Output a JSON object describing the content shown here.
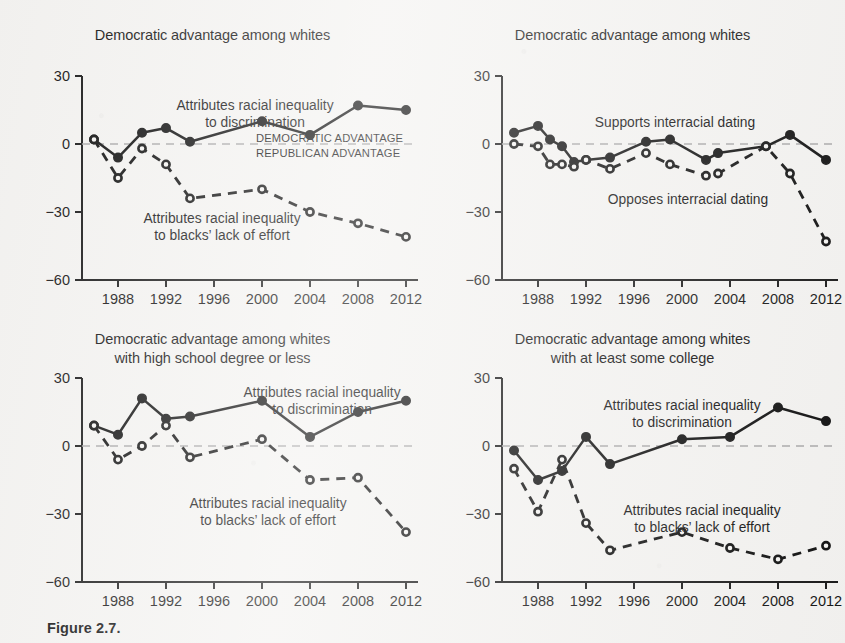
{
  "figure": {
    "caption": "Figure 2.7.",
    "background_color": "#f4f3f1",
    "ink_color": "#121212",
    "zero_line_color": "#a9a9a9",
    "advantage_note_color": "#8e8e8e"
  },
  "axis": {
    "y_ticks": [
      "30",
      "0",
      "−30",
      "−60"
    ],
    "y_values": [
      30,
      0,
      -30,
      -60
    ],
    "x_ticks": [
      "1988",
      "1992",
      "1996",
      "2000",
      "2004",
      "2008",
      "2012"
    ],
    "x_values": [
      1988,
      1992,
      1996,
      2000,
      2004,
      2008,
      2012
    ],
    "ylim": [
      -60,
      30
    ],
    "xlim": [
      1985,
      2013
    ]
  },
  "advantage_labels": {
    "democratic": "DEMOCRATIC ADVANTAGE",
    "republican": "REPUBLICAN ADVANTAGE"
  },
  "chart_data": [
    {
      "id": "panel-top-left",
      "type": "line",
      "title": "Democratic advantage among whites",
      "title_line2": "",
      "xlabel": "",
      "ylabel": "",
      "ylim": [
        -60,
        30
      ],
      "xlim": [
        1985,
        2013
      ],
      "grid": false,
      "zero_reference_line": true,
      "legend_position": "inline-annotations",
      "annotations": [
        {
          "text": "Attributes racial inequality",
          "text2": "to discrimination",
          "series": "discrimination"
        },
        {
          "text": "Attributes racial inequality",
          "text2": "to blacks’ lack of effort",
          "series": "effort"
        },
        {
          "text": "DEMOCRATIC ADVANTAGE",
          "series": "axis-note"
        },
        {
          "text": "REPUBLICAN ADVANTAGE",
          "series": "axis-note"
        }
      ],
      "series": [
        {
          "name": "Attributes racial inequality to discrimination",
          "style": "solid",
          "marker": "filled-circle",
          "x": [
            1986,
            1988,
            1990,
            1992,
            1994,
            2000,
            2004,
            2008,
            2012
          ],
          "values": [
            2,
            -6,
            5,
            7,
            1,
            10,
            4,
            17,
            15
          ]
        },
        {
          "name": "Attributes racial inequality to blacks’ lack of effort",
          "style": "dashed",
          "marker": "open-circle",
          "x": [
            1986,
            1988,
            1990,
            1992,
            1994,
            2000,
            2004,
            2008,
            2012
          ],
          "values": [
            2,
            -15,
            -2,
            -9,
            -24,
            -20,
            -30,
            -35,
            -41
          ]
        }
      ]
    },
    {
      "id": "panel-top-right",
      "type": "line",
      "title": "Democratic advantage among whites",
      "title_line2": "",
      "xlabel": "",
      "ylabel": "",
      "ylim": [
        -60,
        30
      ],
      "xlim": [
        1985,
        2013
      ],
      "grid": false,
      "zero_reference_line": true,
      "legend_position": "inline-annotations",
      "annotations": [
        {
          "text": "Supports interracial dating",
          "series": "supports"
        },
        {
          "text": "Opposes interracial dating",
          "series": "opposes"
        }
      ],
      "series": [
        {
          "name": "Supports interracial dating",
          "style": "solid",
          "marker": "filled-circle",
          "x": [
            1986,
            1988,
            1989,
            1990,
            1991,
            1992,
            1994,
            1997,
            1999,
            2002,
            2003,
            2007,
            2009,
            2012
          ],
          "values": [
            5,
            8,
            2,
            -1,
            -8,
            -7,
            -6,
            1,
            2,
            -7,
            -4,
            -1,
            4,
            -7
          ]
        },
        {
          "name": "Opposes interracial dating",
          "style": "dashed",
          "marker": "open-circle",
          "x": [
            1986,
            1988,
            1989,
            1990,
            1991,
            1992,
            1994,
            1997,
            1999,
            2002,
            2003,
            2007,
            2009,
            2012
          ],
          "values": [
            0,
            -1,
            -9,
            -9,
            -10,
            -7,
            -11,
            -4,
            -9,
            -14,
            -13,
            -1,
            -13,
            -43
          ]
        }
      ]
    },
    {
      "id": "panel-bottom-left",
      "type": "line",
      "title": "Democratic advantage among whites",
      "title_line2": "with high school degree or less",
      "xlabel": "",
      "ylabel": "",
      "ylim": [
        -60,
        30
      ],
      "xlim": [
        1985,
        2013
      ],
      "grid": false,
      "zero_reference_line": true,
      "legend_position": "inline-annotations",
      "annotations": [
        {
          "text": "Attributes racial inequality",
          "text2": "to discrimination",
          "series": "discrimination"
        },
        {
          "text": "Attributes racial inequality",
          "text2": "to blacks’ lack of effort",
          "series": "effort"
        }
      ],
      "series": [
        {
          "name": "Attributes racial inequality to discrimination",
          "style": "solid",
          "marker": "filled-circle",
          "x": [
            1986,
            1988,
            1990,
            1992,
            1994,
            2000,
            2004,
            2008,
            2012
          ],
          "values": [
            9,
            5,
            21,
            12,
            13,
            20,
            4,
            15,
            20
          ]
        },
        {
          "name": "Attributes racial inequality to blacks’ lack of effort",
          "style": "dashed",
          "marker": "open-circle",
          "x": [
            1986,
            1988,
            1990,
            1992,
            1994,
            2000,
            2004,
            2008,
            2012
          ],
          "values": [
            9,
            -6,
            0,
            9,
            -5,
            3,
            -15,
            -14,
            -38
          ]
        }
      ]
    },
    {
      "id": "panel-bottom-right",
      "type": "line",
      "title": "Democratic advantage among whites",
      "title_line2": "with at least some college",
      "xlabel": "",
      "ylabel": "",
      "ylim": [
        -60,
        30
      ],
      "xlim": [
        1985,
        2013
      ],
      "grid": false,
      "zero_reference_line": true,
      "legend_position": "inline-annotations",
      "annotations": [
        {
          "text": "Attributes racial inequality",
          "text2": "to discrimination",
          "series": "discrimination"
        },
        {
          "text": "Attributes racial inequality",
          "text2": "to blacks’ lack of effort",
          "series": "effort"
        }
      ],
      "series": [
        {
          "name": "Attributes racial inequality to discrimination",
          "style": "solid",
          "marker": "filled-circle",
          "x": [
            1986,
            1988,
            1990,
            1992,
            1994,
            2000,
            2004,
            2008,
            2012
          ],
          "values": [
            -2,
            -15,
            -11,
            4,
            -8,
            3,
            4,
            17,
            11
          ]
        },
        {
          "name": "Attributes racial inequality to blacks’ lack of effort",
          "style": "dashed",
          "marker": "open-circle",
          "x": [
            1986,
            1988,
            1990,
            1992,
            1994,
            2000,
            2004,
            2008,
            2012
          ],
          "values": [
            -10,
            -29,
            -6,
            -34,
            -46,
            -38,
            -45,
            -50,
            -44
          ]
        }
      ]
    }
  ]
}
